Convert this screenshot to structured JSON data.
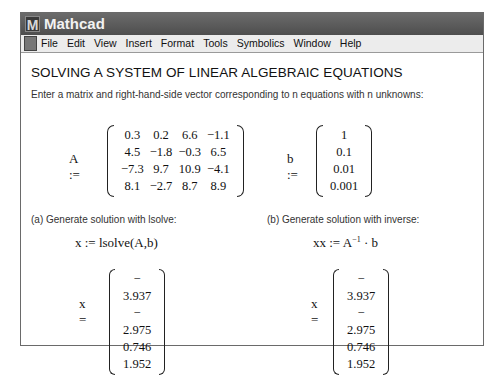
{
  "window": {
    "title": "Mathcad",
    "app_icon": "M"
  },
  "menu": [
    "File",
    "Edit",
    "View",
    "Insert",
    "Format",
    "Tools",
    "Symbolics",
    "Window",
    "Help"
  ],
  "worksheet": {
    "heading": "SOLVING A SYSTEM OF LINEAR ALGEBRAIC EQUATIONS",
    "intro": "Enter a matrix and right-hand-side vector corresponding to n equations with n unknowns:",
    "A": {
      "label": "A :=",
      "rows": [
        [
          "0.3",
          "0.2",
          "6.6",
          "−1.1"
        ],
        [
          "4.5",
          "−1.8",
          "−0.3",
          "6.5"
        ],
        [
          "−7.3",
          "9.7",
          "10.9",
          "−4.1"
        ],
        [
          "8.1",
          "−2.7",
          "8.7",
          "8.9"
        ]
      ]
    },
    "b": {
      "label": "b :=",
      "values": [
        "1",
        "0.1",
        "0.01",
        "0.001"
      ]
    },
    "part_a": {
      "label": "(a) Generate solution with lsolve:",
      "expr": "x := lsolve(A,b)",
      "result_label": "x =",
      "result": [
        "− 3.937",
        "− 2.975",
        "0.746",
        "1.952"
      ]
    },
    "part_b": {
      "label": "(b) Generate solution with inverse:",
      "expr_lhs": "xx :=",
      "expr_base": "A",
      "expr_sup": "−1",
      "expr_rest": "· b",
      "result_label": "x =",
      "result": [
        "− 3.937",
        "− 2.975",
        "0.746",
        "1.952"
      ]
    }
  }
}
